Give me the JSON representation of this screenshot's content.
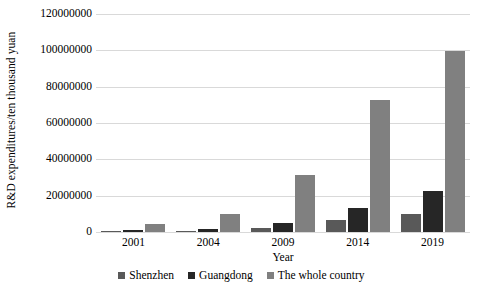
{
  "chart_data": {
    "type": "bar",
    "title": "",
    "xlabel": "Year",
    "ylabel": "R&D expenditures/ten thousand yuan",
    "categories": [
      "2001",
      "2004",
      "2009",
      "2014",
      "2019"
    ],
    "series": [
      {
        "name": "Shenzhen",
        "color": "#595959",
        "values": [
          100000,
          300000,
          2300000,
          6400000,
          10000000
        ]
      },
      {
        "name": "Guangdong",
        "color": "#262626",
        "values": [
          900000,
          1900000,
          5000000,
          13200000,
          22700000
        ]
      },
      {
        "name": "The whole country",
        "color": "#808080",
        "values": [
          4400000,
          9700000,
          31500000,
          72800000,
          99800000
        ]
      }
    ],
    "ylim": [
      0,
      120000000
    ],
    "ytick_step": 20000000,
    "ytick_labels": [
      "0",
      "20000000",
      "40000000",
      "60000000",
      "80000000",
      "100000000",
      "120000000"
    ],
    "grid": true,
    "legend_position": "bottom"
  },
  "legend": {
    "items": [
      {
        "label": "Shenzhen"
      },
      {
        "label": "Guangdong"
      },
      {
        "label": "The whole country"
      }
    ]
  }
}
